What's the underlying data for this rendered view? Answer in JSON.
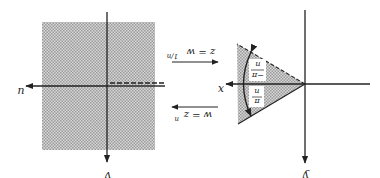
{
  "diagram": {
    "orientation": "rotated 180 degrees",
    "left_panel": {
      "name": "w-plane",
      "axes": {
        "horizontal_label": "u",
        "vertical_label": "v"
      },
      "shading": "entire plane shaded",
      "branch_cut": "slit along negative real axis (double line, dashed)"
    },
    "right_panel": {
      "name": "z-plane",
      "axes": {
        "horizontal_label": "x",
        "vertical_label": "y"
      },
      "shading": "wedge sector",
      "angle_labels": {
        "upper": "π/n",
        "lower": "−π/n"
      }
    },
    "maps": {
      "forward": "w = z^n",
      "forward_base": "w = z",
      "forward_exp": "n",
      "inverse": "z = w^(1/n)",
      "inverse_base": "z = w",
      "inverse_exp": "1/n"
    },
    "colors": {
      "shade": "#b8b8b8",
      "line": "#222222",
      "background": "#ffffff"
    }
  }
}
